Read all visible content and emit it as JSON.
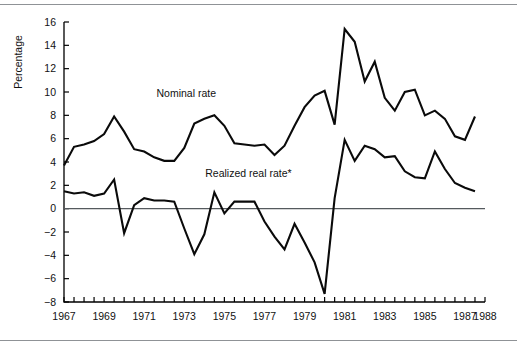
{
  "chart_data": {
    "type": "line",
    "title": "",
    "subtitle": "",
    "xlabel": "",
    "ylabel": "Percentage",
    "ylim": [
      -8,
      16
    ],
    "xlim": [
      1967,
      1988
    ],
    "yticks": [
      16,
      14,
      12,
      10,
      8,
      6,
      4,
      2,
      0,
      -2,
      -4,
      -6,
      -8
    ],
    "ytick_labels": [
      "16",
      "14",
      "12",
      "10",
      "8",
      "6",
      "4",
      "2",
      "0",
      "−2",
      "−4",
      "−6",
      "−8"
    ],
    "xticks": [
      1967,
      1969,
      1971,
      1973,
      1975,
      1977,
      1979,
      1981,
      1983,
      1985,
      1987,
      1988
    ],
    "xtick_labels": [
      "1967",
      "1969",
      "1971",
      "1973",
      "1975",
      "1977",
      "1979",
      "1981",
      "1983",
      "1985",
      "1987",
      "1988"
    ],
    "minor_tick_interval": 0.5,
    "grid": false,
    "legend_position": "inline-annotation",
    "zero_line": 0,
    "annotations": [
      {
        "text": "Nominal rate",
        "x": 1973.1,
        "y": 9.55,
        "series": "Nominal rate"
      },
      {
        "text": "Realized real rate*",
        "x": 1976.2,
        "y": 2.75,
        "series": "Realized real rate*"
      }
    ],
    "series": [
      {
        "name": "Nominal rate",
        "color": "#0a0a0a",
        "x": [
          1967.0,
          1967.5,
          1968.0,
          1968.5,
          1969.0,
          1969.5,
          1970.0,
          1970.5,
          1971.0,
          1971.5,
          1972.0,
          1972.5,
          1973.0,
          1973.5,
          1974.0,
          1974.5,
          1975.0,
          1975.5,
          1976.0,
          1976.5,
          1977.0,
          1977.5,
          1978.0,
          1978.5,
          1979.0,
          1979.5,
          1980.0,
          1980.5,
          1981.0,
          1981.5,
          1982.0,
          1982.5,
          1983.0,
          1983.5,
          1984.0,
          1984.5,
          1985.0,
          1985.5,
          1986.0,
          1986.5,
          1987.0,
          1987.5
        ],
        "values": [
          3.7,
          5.3,
          5.5,
          5.8,
          6.4,
          7.9,
          6.6,
          5.1,
          4.9,
          4.4,
          4.1,
          4.1,
          5.2,
          7.3,
          7.7,
          8.0,
          7.1,
          5.6,
          5.5,
          5.4,
          5.5,
          4.6,
          5.4,
          7.1,
          8.7,
          9.7,
          10.1,
          7.2,
          15.4,
          14.3,
          10.9,
          12.6,
          9.5,
          8.4,
          10.0,
          10.2,
          8.0,
          8.4,
          7.7,
          6.2,
          5.9,
          7.9
        ]
      },
      {
        "name": "Realized real rate*",
        "color": "#0a0a0a",
        "x": [
          1967.0,
          1967.5,
          1968.0,
          1968.5,
          1969.0,
          1969.5,
          1970.0,
          1970.5,
          1971.0,
          1971.5,
          1972.0,
          1972.5,
          1973.0,
          1973.5,
          1974.0,
          1974.5,
          1975.0,
          1975.5,
          1976.0,
          1976.5,
          1977.0,
          1977.5,
          1978.0,
          1978.5,
          1979.0,
          1979.5,
          1980.0,
          1980.5,
          1981.0,
          1981.5,
          1982.0,
          1982.5,
          1983.0,
          1983.5,
          1984.0,
          1984.5,
          1985.0,
          1985.5,
          1986.0,
          1986.5,
          1987.0,
          1987.5
        ],
        "values": [
          1.5,
          1.3,
          1.4,
          1.1,
          1.3,
          2.5,
          -2.1,
          0.3,
          0.9,
          0.7,
          0.7,
          0.6,
          -1.7,
          -3.9,
          -2.2,
          1.4,
          -0.4,
          0.6,
          0.6,
          0.6,
          -1.1,
          -2.4,
          -3.5,
          -1.3,
          -2.9,
          -4.6,
          -7.3,
          0.9,
          5.9,
          4.1,
          5.4,
          5.1,
          4.4,
          4.5,
          3.2,
          2.7,
          2.6,
          4.9,
          3.4,
          2.2,
          1.8,
          1.5
        ]
      }
    ]
  },
  "figure": {
    "top_rule": "",
    "bottom_rule": ""
  }
}
